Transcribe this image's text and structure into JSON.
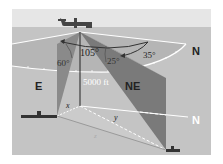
{
  "diagram": {
    "colors": {
      "sky": "#e6e6e6",
      "sea": "#c4c4c4",
      "disk": "#b4b4b4",
      "plane_dark": "#8a8a8a",
      "plane_darker": "#6a6a6a",
      "white": "#ffffff",
      "text_dark": "#222222"
    },
    "labels": {
      "angle_105": "105°",
      "angle_60": "60°",
      "angle_25": "25°",
      "angle_35": "35°",
      "altitude": "5000 ft",
      "dir_E": "E",
      "dir_NE": "NE",
      "dir_N_top": "N",
      "dir_N_bottom": "N",
      "seg_x": "x",
      "seg_y": "y",
      "seg_z": "z"
    },
    "icons": {
      "airplane": "airplane-icon",
      "ship_left": "ship-icon",
      "ship_right": "ship-icon"
    }
  }
}
